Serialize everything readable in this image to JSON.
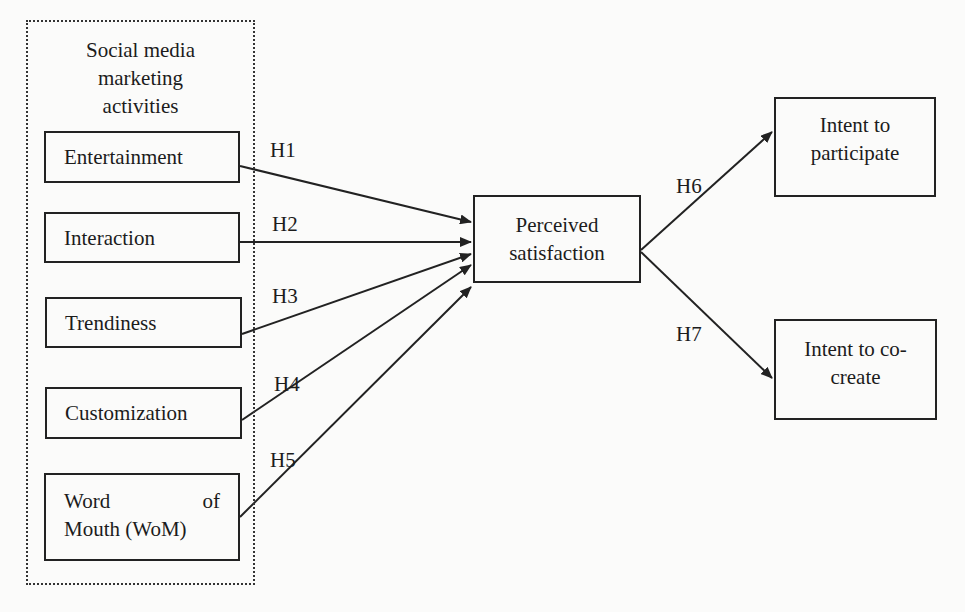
{
  "figure": {
    "type": "research-model",
    "group": {
      "title_lines": [
        "Social media",
        "marketing",
        "activities"
      ],
      "items": [
        {
          "id": "entertainment",
          "label": "Entertainment"
        },
        {
          "id": "interaction",
          "label": "Interaction"
        },
        {
          "id": "trendiness",
          "label": "Trendiness"
        },
        {
          "id": "customization",
          "label": "Customization"
        },
        {
          "id": "wom",
          "label_line1_a": "Word",
          "label_line1_b": "of",
          "label_line2": "Mouth (WoM)"
        }
      ]
    },
    "mediator": {
      "line1": "Perceived",
      "line2": "satisfaction"
    },
    "outcomes": [
      {
        "id": "participate",
        "line1": "Intent to",
        "line2": "participate"
      },
      {
        "id": "cocreate",
        "line1": "Intent to co-",
        "line2": "create"
      }
    ],
    "hypotheses": [
      {
        "label": "H1",
        "from": "Entertainment",
        "to": "Perceived satisfaction"
      },
      {
        "label": "H2",
        "from": "Interaction",
        "to": "Perceived satisfaction"
      },
      {
        "label": "H3",
        "from": "Trendiness",
        "to": "Perceived satisfaction"
      },
      {
        "label": "H4",
        "from": "Customization",
        "to": "Perceived satisfaction"
      },
      {
        "label": "H5",
        "from": "Word of Mouth (WoM)",
        "to": "Perceived satisfaction"
      },
      {
        "label": "H6",
        "from": "Perceived satisfaction",
        "to": "Intent to participate"
      },
      {
        "label": "H7",
        "from": "Perceived satisfaction",
        "to": "Intent to co-create"
      }
    ]
  },
  "colors": {
    "line": "#222222",
    "background": "#fbfbfa",
    "ghost_text": "rgba(0,0,0,0.09)"
  }
}
